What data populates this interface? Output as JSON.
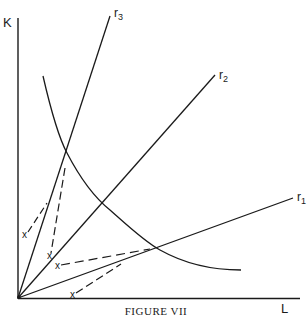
{
  "figure": {
    "caption": "FIGURE VII",
    "axes": {
      "y_label": "K",
      "x_label": "L"
    },
    "rays": [
      {
        "id": "r3",
        "label_base": "r",
        "label_sub": "3"
      },
      {
        "id": "r2",
        "label_base": "r",
        "label_sub": "2"
      },
      {
        "id": "r1",
        "label_base": "r",
        "label_sub": "1"
      }
    ],
    "points": [
      {
        "id": "p1",
        "label": "x"
      },
      {
        "id": "p2",
        "label": "x"
      },
      {
        "id": "p3",
        "label": "x"
      },
      {
        "id": "p4",
        "label": "x"
      }
    ],
    "colors": {
      "ink": "#1a1a1a",
      "background": "#ffffff"
    }
  }
}
